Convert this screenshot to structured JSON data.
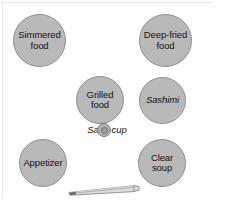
{
  "diagram": {
    "background_color": "#ffffff",
    "dish_fill_color": "#b9b9b9",
    "dish_border_color": "#8f8f8f",
    "text_color": "#111111",
    "dishes": [
      {
        "id": "simmered",
        "label": "Simmered\nfood",
        "italic": false
      },
      {
        "id": "deepfried",
        "label": "Deep-fried\nfood",
        "italic": false
      },
      {
        "id": "grilled",
        "label": "Grilled\nfood",
        "italic": false
      },
      {
        "id": "sashimi",
        "label": "Sashimi",
        "italic": true
      },
      {
        "id": "appetizer",
        "label": "Appetizer",
        "italic": false
      },
      {
        "id": "clearsoup",
        "label": "Clear soup",
        "italic": false
      }
    ],
    "sake": {
      "label": "Sake cup"
    },
    "chopsticks": {
      "label": "chopsticks"
    }
  }
}
